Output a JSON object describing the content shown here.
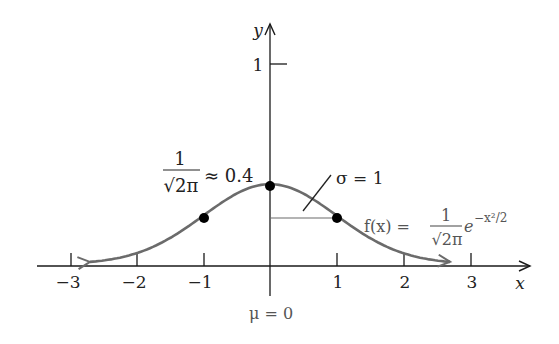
{
  "chart_data": {
    "type": "line",
    "xlabel": "x",
    "ylabel": "y",
    "xlim": [
      -3.5,
      3.9
    ],
    "ylim": [
      0,
      1.15
    ],
    "grid": false,
    "x_ticks": [
      -3,
      -2,
      -1,
      1,
      2,
      3
    ],
    "x_tick_labels": [
      "−3",
      "−2",
      "−1",
      "1",
      "2",
      "3"
    ],
    "y_ticks": [
      1
    ],
    "y_tick_labels": [
      "1"
    ],
    "series": [
      {
        "name": "f(x) = 1/√(2π) e^(−x²/2)",
        "x": [
          -2.7,
          -2.5,
          -2,
          -1.5,
          -1,
          -0.5,
          0,
          0.5,
          1,
          1.5,
          2,
          2.5,
          2.7
        ],
        "values": [
          0.01,
          0.018,
          0.054,
          0.13,
          0.242,
          0.352,
          0.399,
          0.352,
          0.242,
          0.13,
          0.054,
          0.018,
          0.01
        ]
      }
    ],
    "marked_points": [
      {
        "x": -1,
        "y": 0.242
      },
      {
        "x": 0,
        "y": 0.399
      },
      {
        "x": 1,
        "y": 0.242
      }
    ],
    "annotations": [
      {
        "text": "1/√(2π) ≈ 0.4",
        "at": "peak"
      },
      {
        "text": "σ = 1",
        "at": "horizontal segment from x=0 to x=1"
      },
      {
        "text": "f(x) = 1/√(2π) e^(−x²/2)",
        "at": "right of curve"
      },
      {
        "text": "μ = 0",
        "at": "below origin"
      }
    ]
  },
  "labels": {
    "y_axis": "y",
    "x_axis": "x",
    "y_tick_1": "1",
    "ticks": [
      "−3",
      "−2",
      "−1",
      "1",
      "2",
      "3"
    ],
    "peak_num": "1",
    "peak_den": "√2π",
    "peak_approx": "≈ 0.4",
    "sigma": "σ = 1",
    "fx_lhs": "f(x) =",
    "fx_num": "1",
    "fx_den": "√2π",
    "fx_e": "e",
    "fx_exp": "−x²/2",
    "mu": "μ = 0"
  },
  "colors": {
    "axis": "#1a1a1a",
    "curve": "#6b6b6b",
    "points": "#000000",
    "text": "#222222"
  }
}
